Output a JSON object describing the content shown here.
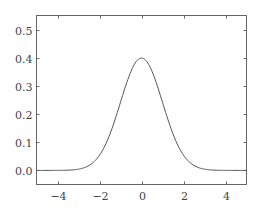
{
  "chart_data": {
    "type": "line",
    "title": "",
    "xlabel": "",
    "ylabel": "",
    "xlim": [
      -5,
      5
    ],
    "ylim": [
      -0.05,
      0.55
    ],
    "grid": false,
    "legend": null,
    "x_ticks": [
      -4,
      -2,
      0,
      2,
      4
    ],
    "x_tick_labels": [
      "−4",
      "−2",
      "0",
      "2",
      "4"
    ],
    "y_ticks": [
      0.0,
      0.1,
      0.2,
      0.3,
      0.4,
      0.5
    ],
    "y_tick_labels": [
      "0.0",
      "0.1",
      "0.2",
      "0.3",
      "0.4",
      "0.5"
    ],
    "series": [
      {
        "name": "standard normal PDF",
        "function": "exp(-x^2/2)/sqrt(2*pi)",
        "color": "#555555",
        "x": [
          -5,
          -4,
          -3,
          -2.5,
          -2,
          -1.5,
          -1,
          -0.5,
          0,
          0.5,
          1,
          1.5,
          2,
          2.5,
          3,
          4,
          5
        ],
        "y": [
          0.0,
          0.0001,
          0.0044,
          0.0175,
          0.054,
          0.1295,
          0.242,
          0.3521,
          0.3989,
          0.3521,
          0.242,
          0.1295,
          0.054,
          0.0175,
          0.0044,
          0.0001,
          0.0
        ]
      }
    ]
  },
  "colors": {
    "frame": "#666666",
    "line": "#555555",
    "text": "#444444"
  }
}
